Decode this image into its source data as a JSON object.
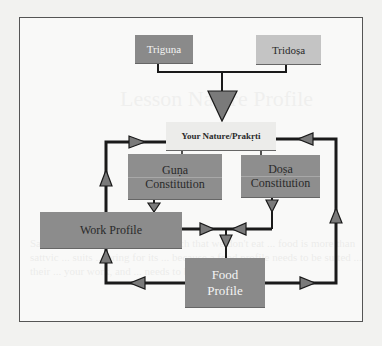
{
  "diagram": {
    "nodes": {
      "triguna": "Triguṇa",
      "tridosa": "Tridoṣa",
      "nature": "Your Nature/Prakṛti",
      "guna_line1": "Guṇa",
      "guna_line2": "Constitution",
      "dosa_line1": "Doṣa",
      "dosa_line2": "Constitution",
      "work": "Work Profile",
      "food_line1": "Food",
      "food_line2": "Profile"
    },
    "edges": [
      {
        "from": "Triguṇa",
        "to": "Your Nature/Prakṛti"
      },
      {
        "from": "Tridoṣa",
        "to": "Your Nature/Prakṛti"
      },
      {
        "from": "Your Nature/Prakṛti",
        "to": "Guṇa Constitution"
      },
      {
        "from": "Your Nature/Prakṛti",
        "to": "Doṣa Constitution"
      },
      {
        "from": "Guṇa Constitution",
        "to": "Work Profile"
      },
      {
        "from": "Doṣa Constitution",
        "to": "Food Profile"
      },
      {
        "from": "Work Profile",
        "to": "Food Profile"
      },
      {
        "from": "Work Profile",
        "to": "Your Nature/Prakṛti"
      },
      {
        "from": "Food Profile",
        "to": "Work Profile"
      },
      {
        "from": "Food Profile",
        "to": "Your Nature/Prakṛti"
      }
    ],
    "colors": {
      "triguna": "#8a8a8a",
      "tridosa": "#c4c4c4",
      "nature": "#ececea",
      "constitution": "#8e8e8e",
      "profile": "#8a8a8a",
      "arrow": "#7a7a7a",
      "line": "#1a1a1a"
    }
  },
  "background_bleed": {
    "heading": "Lesson Nature Profile",
    "paragraph": "Sadhana or spiritual practice ... such that we don't eat ... food is more than sattvic ... suits ... bring for its ... because a food profile needs to be suited ... their ... your work, and ... needs to be ... and so"
  }
}
